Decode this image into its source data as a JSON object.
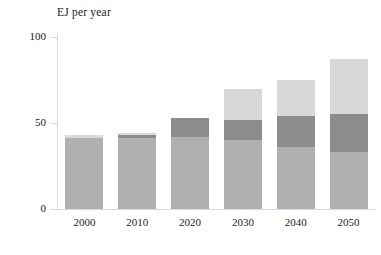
{
  "chart_data": {
    "type": "bar",
    "stacked": true,
    "title": "EJ per year",
    "xlabel": "",
    "ylabel": "EJ per year",
    "categories": [
      "2000",
      "2010",
      "2020",
      "2030",
      "2040",
      "2050"
    ],
    "ylim": [
      0,
      100
    ],
    "yticks": [
      0,
      50,
      100
    ],
    "ytick_labels": [
      "0",
      "50",
      "100"
    ],
    "grid": false,
    "legend": "none",
    "series": [
      {
        "name": "series-1-light-gray",
        "color": "#b0b0b0",
        "values": [
          41,
          41,
          42,
          40,
          36,
          33
        ]
      },
      {
        "name": "series-2-dark-gray",
        "color": "#8c8c8c",
        "values": [
          0,
          2,
          11,
          12,
          18,
          22
        ]
      },
      {
        "name": "series-3-pale-gray",
        "color": "#d8d8d8",
        "values": [
          2,
          1,
          0,
          18,
          21,
          32
        ]
      }
    ],
    "totals": [
      43,
      44,
      53,
      70,
      75,
      87
    ]
  },
  "axis": {
    "title": "EJ per year",
    "y_ticks": [
      "100",
      "50",
      "0"
    ],
    "x_ticks": [
      "2000",
      "2010",
      "2020",
      "2030",
      "2040",
      "2050"
    ]
  },
  "colors": {
    "series_light": "#b0b0b0",
    "series_dark": "#8c8c8c",
    "series_pale": "#d8d8d8",
    "axis_line": "#d9d9d9",
    "text": "#1c1c1c",
    "background": "#ffffff"
  }
}
